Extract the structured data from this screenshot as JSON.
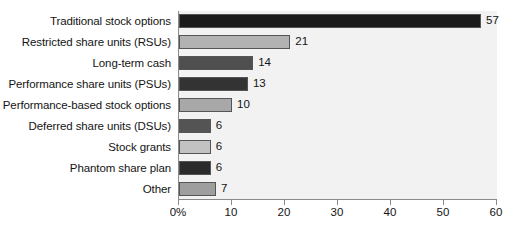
{
  "chart_data": {
    "type": "bar",
    "orientation": "horizontal",
    "title": "",
    "xlabel": "",
    "ylabel": "",
    "xlim": [
      0,
      60
    ],
    "xticks": [
      0,
      10,
      20,
      30,
      40,
      50,
      60
    ],
    "xtick_labels": [
      "0%",
      "10",
      "20",
      "30",
      "40",
      "50",
      "60"
    ],
    "grid": false,
    "legend": "none",
    "categories": [
      "Traditional stock options",
      "Restricted share units (RSUs)",
      "Long-term cash",
      "Performance share units (PSUs)",
      "Performance-based stock options",
      "Deferred share units (DSUs)",
      "Stock grants",
      "Phantom share plan",
      "Other"
    ],
    "values": [
      57,
      21,
      14,
      13,
      10,
      6,
      6,
      6,
      7
    ],
    "value_labels": [
      "57",
      "21",
      "14",
      "13",
      "10",
      "6",
      "6",
      "6",
      "7"
    ],
    "bar_colors": [
      "#1c1c1c",
      "#b2b2b2",
      "#4f4f4f",
      "#333333",
      "#a8a8a8",
      "#545454",
      "#c2c2c2",
      "#2b2b2b",
      "#9e9e9e"
    ]
  },
  "colors": {
    "plot_background": "#f2f2f2",
    "page_background": "#ffffff",
    "axis_line": "#8a8a8a",
    "bar_border": "#555555",
    "text": "#141414"
  }
}
